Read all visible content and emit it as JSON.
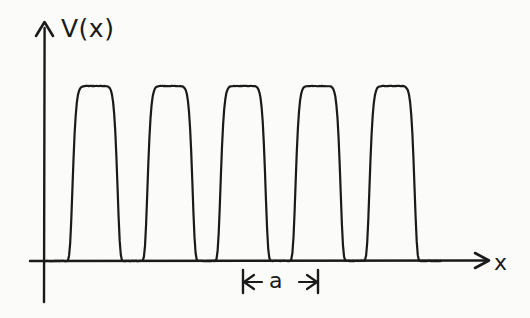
{
  "figure": {
    "kind": "hand-drawn-line-plot",
    "background_color": "#fbfbf9",
    "ink_color": "#1a1a1a"
  },
  "labels": {
    "y_axis": "V(x)",
    "x_axis": "x",
    "period": "a"
  },
  "chart_data": {
    "type": "line",
    "title": "",
    "subtitle": "",
    "xlabel": "x",
    "ylabel": "V(x)",
    "grid": false,
    "legend": null,
    "axes": {
      "x": {
        "ticks": [],
        "tick_labels": [],
        "arrow": true,
        "origin_px": 44,
        "baseline_px": 261,
        "end_px": 487
      },
      "y": {
        "ticks": [],
        "tick_labels": [],
        "arrow": true,
        "top_px": 22,
        "bottom_px": 302
      }
    },
    "series": [
      {
        "name": "V(x)",
        "description": "periodic array of five identical flat-topped barriers",
        "peak_centers_px": [
          95,
          170,
          243,
          318,
          392
        ],
        "peak_top_px": 86,
        "peak_half_width_px": 26,
        "peak_flatness_exponent": 5,
        "values": [
          0,
          1,
          0,
          1,
          0,
          1,
          0,
          1,
          0,
          1,
          0
        ],
        "x": [
          60,
          95,
          132,
          170,
          206,
          243,
          280,
          318,
          355,
          392,
          428
        ]
      }
    ],
    "annotations": [
      {
        "name": "period-measure",
        "text": "a",
        "type": "double-headed-arrow",
        "from_px": 243,
        "to_px": 318,
        "y_px": 282,
        "value_px": 75
      }
    ]
  }
}
